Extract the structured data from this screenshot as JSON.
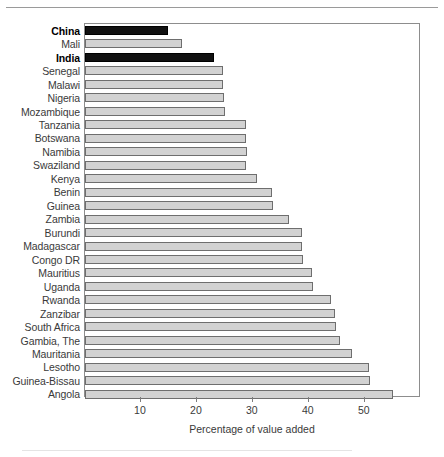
{
  "chart_data": {
    "type": "bar",
    "orientation": "horizontal",
    "title": "",
    "xlabel": "Percentage of value added",
    "ylabel": "",
    "xlim": [
      0,
      59.7
    ],
    "xticks": [
      10,
      20,
      30,
      40,
      50
    ],
    "grid": false,
    "legend": false,
    "categories": [
      "China",
      "Mali",
      "India",
      "Senegal",
      "Malawi",
      "Nigeria",
      "Mozambique",
      "Tanzania",
      "Botswana",
      "Namibia",
      "Swaziland",
      "Kenya",
      "Benin",
      "Guinea",
      "Zambia",
      "Burundi",
      "Madagascar",
      "Congo DR",
      "Mauritius",
      "Uganda",
      "Rwanda",
      "Zanzibar",
      "South Africa",
      "Gambia, The",
      "Mauritania",
      "Lesotho",
      "Guinea-Bissau",
      "Angola"
    ],
    "values": [
      14.8,
      17.4,
      23.0,
      24.6,
      24.7,
      24.9,
      25.0,
      28.7,
      28.7,
      29.0,
      28.8,
      30.8,
      33.5,
      33.6,
      36.4,
      38.7,
      38.8,
      38.9,
      40.5,
      40.7,
      43.9,
      44.7,
      44.8,
      45.5,
      47.8,
      50.8,
      50.9,
      55.1
    ],
    "highlighted": [
      "China",
      "India"
    ],
    "colors": {
      "bar_fill": "#d2d2d2",
      "bar_stroke": "#6e6e6e",
      "highlight_fill": "#111111",
      "axis": "#8d8d8d",
      "text": "#3a3a3a"
    }
  }
}
